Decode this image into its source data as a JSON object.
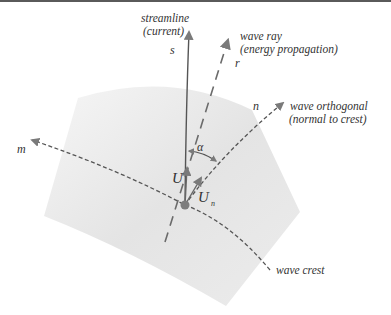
{
  "diagram": {
    "labels": {
      "streamline_line1": "streamline",
      "streamline_line2": "(current)",
      "streamline_var": "s",
      "ray_line1": "wave ray",
      "ray_line2": "(energy propagation)",
      "ray_var": "r",
      "orthogonal_line1": "wave orthogonal",
      "orthogonal_line2": "(normal to crest)",
      "orthogonal_var": "n",
      "crest_var": "m",
      "crest_label": "wave crest",
      "angle": "α",
      "velocity": "U",
      "normal_velocity_main": "U",
      "normal_velocity_sub": "n"
    },
    "colors": {
      "line": "#6b6b6b",
      "arrow": "#7a7a7a",
      "point": "#7d7d7d",
      "region": "#e6e6e6",
      "text": "#333333"
    },
    "elements": [
      {
        "id": "streamline",
        "style": "solid",
        "arrow": "end"
      },
      {
        "id": "wave-ray",
        "style": "dashed",
        "arrow": "end"
      },
      {
        "id": "wave-orthogonal",
        "style": "dashed",
        "arrow": "end"
      },
      {
        "id": "wave-crest",
        "style": "dashed",
        "arrow": "start"
      },
      {
        "id": "velocity-U",
        "style": "solid",
        "arrow": "end"
      },
      {
        "id": "velocity-Un",
        "style": "solid",
        "arrow": "end"
      },
      {
        "id": "angle-alpha",
        "style": "solid",
        "arrow": "both"
      }
    ]
  }
}
